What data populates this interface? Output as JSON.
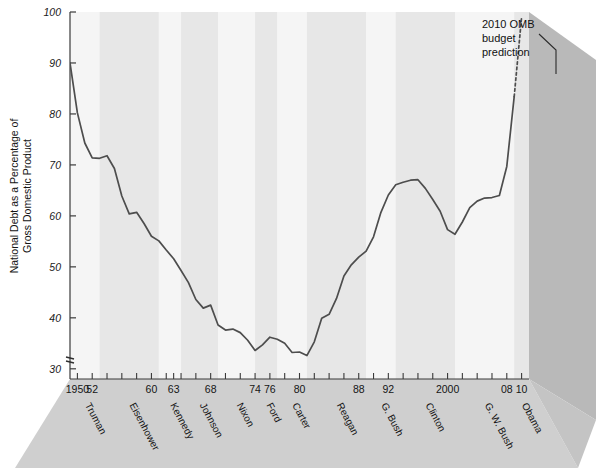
{
  "chart_data": {
    "type": "line",
    "title": "",
    "xlabel": "",
    "ylabel": "National Debt as a Percentage of Gross Domestic Product",
    "ylabel_line1": "National Debt as a Percentage of",
    "ylabel_line2": "Gross Domestic Product",
    "ylim": [
      28,
      100
    ],
    "xlim": [
      1949,
      2011
    ],
    "axis_break": true,
    "axis_break_symbol": "≈",
    "grid": false,
    "legend": false,
    "y_ticks": [
      30,
      40,
      50,
      60,
      70,
      80,
      90,
      100
    ],
    "y_tick_labels": [
      "30",
      "40",
      "50",
      "60",
      "70",
      "80",
      "90",
      "100"
    ],
    "x_ticks": [
      1950,
      1952,
      1954,
      1956,
      1958,
      1960,
      1962,
      1963,
      1964,
      1966,
      1968,
      1970,
      1972,
      1974,
      1976,
      1978,
      1980,
      1982,
      1984,
      1986,
      1988,
      1990,
      1992,
      1994,
      1996,
      1998,
      2000,
      2002,
      2004,
      2006,
      2008,
      2010
    ],
    "x_tick_labels": [
      {
        "year": 1950,
        "label": "1950"
      },
      {
        "year": 1952,
        "label": "52"
      },
      {
        "year": 1960,
        "label": "60"
      },
      {
        "year": 1963,
        "label": "63"
      },
      {
        "year": 1968,
        "label": "68"
      },
      {
        "year": 1974,
        "label": "74"
      },
      {
        "year": 1976,
        "label": "76"
      },
      {
        "year": 1980,
        "label": "80"
      },
      {
        "year": 1988,
        "label": "88"
      },
      {
        "year": 1992,
        "label": "92"
      },
      {
        "year": 2000,
        "label": "2000"
      },
      {
        "year": 2008,
        "label": "08"
      },
      {
        "year": 2010,
        "label": "10"
      }
    ],
    "presidents": [
      {
        "name": "Truman",
        "start": 1949,
        "end": 1953
      },
      {
        "name": "Eisenhower",
        "start": 1953,
        "end": 1961
      },
      {
        "name": "Kennedy",
        "start": 1961,
        "end": 1964
      },
      {
        "name": "Johnson",
        "start": 1964,
        "end": 1969
      },
      {
        "name": "Nixon",
        "start": 1969,
        "end": 1974
      },
      {
        "name": "Ford",
        "start": 1974,
        "end": 1977
      },
      {
        "name": "Carter",
        "start": 1977,
        "end": 1981
      },
      {
        "name": "Reagan",
        "start": 1981,
        "end": 1989
      },
      {
        "name": "G. Bush",
        "start": 1989,
        "end": 1993
      },
      {
        "name": "Clinton",
        "start": 1993,
        "end": 2001
      },
      {
        "name": "G. W. Bush",
        "start": 2001,
        "end": 2009
      },
      {
        "name": "Obama",
        "start": 2009,
        "end": 2011
      }
    ],
    "annotations": [
      {
        "text_line1": "2010 OMB",
        "text_line2": "budget",
        "text_line3": "prediction",
        "text": "2010 OMB budget prediction",
        "target_year": 2010,
        "target_value": 99
      }
    ],
    "series": [
      {
        "name": "National Debt as % of GDP",
        "style": "solid",
        "x": [
          1949,
          1950,
          1951,
          1952,
          1953,
          1954,
          1955,
          1956,
          1957,
          1958,
          1959,
          1960,
          1961,
          1962,
          1963,
          1964,
          1965,
          1966,
          1967,
          1968,
          1969,
          1970,
          1971,
          1972,
          1973,
          1974,
          1975,
          1976,
          1977,
          1978,
          1979,
          1980,
          1981,
          1982,
          1983,
          1984,
          1985,
          1986,
          1987,
          1988,
          1989,
          1990,
          1991,
          1992,
          1993,
          1994,
          1995,
          1996,
          1997,
          1998,
          1999,
          2000,
          2001,
          2002,
          2003,
          2004,
          2005,
          2006,
          2007,
          2008,
          2009
        ],
        "values": [
          90.0,
          80.2,
          74.3,
          71.4,
          71.3,
          71.8,
          69.3,
          63.9,
          60.4,
          60.7,
          58.5,
          56.0,
          55.1,
          53.3,
          51.6,
          49.3,
          46.9,
          43.6,
          41.9,
          42.5,
          38.6,
          37.6,
          37.8,
          37.1,
          35.6,
          33.6,
          34.7,
          36.2,
          35.8,
          35.0,
          33.2,
          33.3,
          32.6,
          35.3,
          39.9,
          40.7,
          43.8,
          48.2,
          50.4,
          51.9,
          53.1,
          55.9,
          60.7,
          64.1,
          66.1,
          66.6,
          67.0,
          67.1,
          65.4,
          63.2,
          60.9,
          57.3,
          56.4,
          58.8,
          61.6,
          62.9,
          63.5,
          63.6,
          64.0,
          69.7,
          83.4
        ]
      },
      {
        "name": "2010 OMB budget prediction",
        "style": "dotted",
        "x": [
          2009,
          2010
        ],
        "values": [
          83.4,
          99.0
        ]
      }
    ]
  },
  "colors": {
    "line": "#4d4d4d",
    "stripe_light": "#f5f5f5",
    "stripe_dark": "#e7e7e7",
    "platform": "#cfcfcf",
    "platform_right": "#b7b7b7",
    "axis": "#3a3a3a",
    "text": "#141414"
  }
}
